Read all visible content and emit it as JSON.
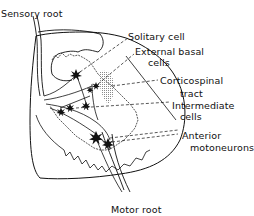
{
  "diagram": {
    "labels": {
      "sensory_root": "Sensory root",
      "solitary_cell": "Solitary cell",
      "external_basal_line1": "External basal",
      "external_basal_line2": "cells",
      "corticospinal_line1": "Corticospinal",
      "corticospinal_line2": "tract",
      "intermediate_line1": "Intermediate",
      "intermediate_line2": "cells",
      "anterior_line1": "Anterior",
      "anterior_line2": "motoneurons",
      "motor_root": "Motor root"
    },
    "colors": {
      "ink": "#111111",
      "stipple": "#9a9a9a",
      "background": "#ffffff"
    }
  }
}
